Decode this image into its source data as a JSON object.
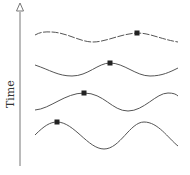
{
  "axis": {
    "label": "Time",
    "color": "#666666",
    "x": 20,
    "y_top": 14,
    "y_bottom": 166
  },
  "waves": [
    {
      "id": "wave-1",
      "path": "M35,35 C42,31 48,32 52,32 C68,33 80,42 93,42 C106,42 120,34 137,33 C150,33 160,39 178,42",
      "marker": {
        "x": 137,
        "y": 33
      },
      "dashed": true
    },
    {
      "id": "wave-2",
      "path": "M35,65 C50,70 58,76 72,76 C88,76 98,63 110,63 C124,63 136,76 150,76 C162,76 170,72 178,68",
      "marker": {
        "x": 110,
        "y": 63
      },
      "dashed": false
    },
    {
      "id": "wave-3",
      "path": "M35,110 C50,109 65,93 84,93 C104,93 112,111 128,111 C144,111 156,93 168,93 C173,93 176,94 178,96",
      "marker": {
        "x": 84,
        "y": 93
      },
      "dashed": false
    },
    {
      "id": "wave-4",
      "path": "M35,135 C44,126 50,122 57,122 C74,122 88,149 104,149 C120,149 130,122 144,122 C158,122 168,138 178,146",
      "marker": {
        "x": 57,
        "y": 122
      },
      "dashed": false
    }
  ],
  "colors": {
    "line": "#555555",
    "marker": "#222222"
  }
}
